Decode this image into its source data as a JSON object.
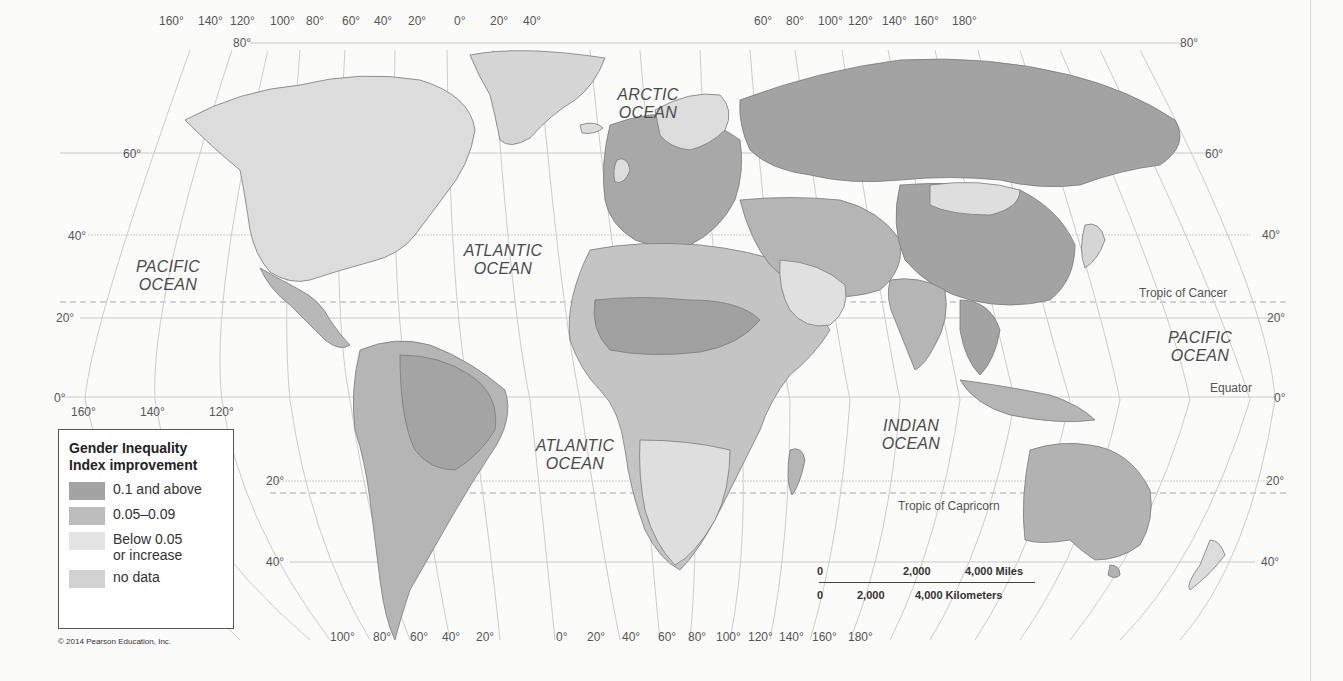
{
  "map": {
    "title": "Gender Inequality Index improvement",
    "colors": {
      "background": "#fbfbfa",
      "ocean": "#fbfbfa",
      "grid": "#c8c8c8",
      "tier_high": "#9e9e9e",
      "tier_mid": "#b5b5b5",
      "tier_low": "#dcdcdc",
      "no_data": "#cdcdcd"
    },
    "top_longitudes": [
      "160°",
      "140°",
      "120°",
      "100°",
      "80°",
      "60°",
      "40°",
      "20°",
      "0°",
      "20°",
      "40°",
      "60°",
      "80°",
      "100°",
      "120°",
      "140°",
      "160°",
      "180°"
    ],
    "bottom_longitudes": [
      "100°",
      "80°",
      "60°",
      "40°",
      "20°",
      "0°",
      "20°",
      "40°",
      "60°",
      "80°",
      "100°",
      "120°",
      "140°",
      "160°",
      "180°"
    ],
    "equator_longitudes": [
      "160°",
      "140°",
      "120°"
    ],
    "left_latitudes": [
      "80°",
      "60°",
      "40°",
      "20°",
      "0°",
      "20°",
      "40°"
    ],
    "right_latitudes": [
      "80°",
      "60°",
      "40°",
      "20°",
      "0°",
      "20°",
      "40°"
    ],
    "oceans": {
      "arctic": [
        "ARCTIC",
        "OCEAN"
      ],
      "atlantic_north": [
        "ATLANTIC",
        "OCEAN"
      ],
      "atlantic_south": [
        "ATLANTIC",
        "OCEAN"
      ],
      "pacific_east": [
        "PACIFIC",
        "OCEAN"
      ],
      "pacific_west": [
        "PACIFIC",
        "OCEAN"
      ],
      "indian": [
        "INDIAN",
        "OCEAN"
      ]
    },
    "reference_lines": {
      "tropic_cancer": "Tropic of Cancer",
      "equator": "Equator",
      "tropic_capricorn": "Tropic of Capricorn"
    }
  },
  "legend": {
    "title_line1": "Gender Inequality",
    "title_line2": "Index improvement",
    "items": [
      {
        "label": "0.1 and above",
        "color": "#a3a3a3"
      },
      {
        "label": "0.05–0.09",
        "color": "#bcbcbc"
      },
      {
        "label": "Below 0.05",
        "label2": "or increase",
        "color": "#e4e4e4"
      },
      {
        "label": "no data",
        "color": "#d2d2d2"
      }
    ]
  },
  "scale_bar": {
    "miles": [
      "0",
      "2,000",
      "4,000 Miles"
    ],
    "kilometers": [
      "0",
      "2,000",
      "4,000 Kilometers"
    ]
  },
  "copyright": "© 2014 Pearson Education, Inc."
}
